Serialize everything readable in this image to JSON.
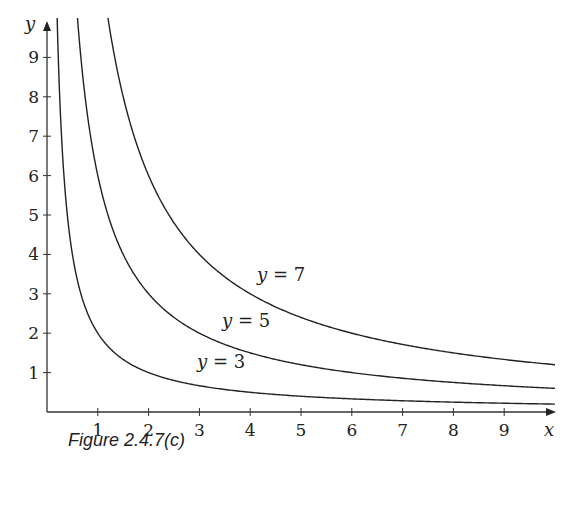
{
  "chart_data": {
    "type": "line",
    "title": "",
    "caption": "Figure 2.4.7(c)",
    "xlabel": "x",
    "ylabel": "y",
    "xlim": [
      0,
      10
    ],
    "ylim": [
      0,
      10
    ],
    "grid": false,
    "x_ticks": [
      1,
      2,
      3,
      4,
      5,
      6,
      7,
      8,
      9
    ],
    "y_ticks": [
      1,
      2,
      3,
      4,
      5,
      6,
      7,
      8,
      9
    ],
    "series": [
      {
        "name": "y = 3",
        "label_text": "y = 3",
        "formula_approx": "y = 2/x",
        "x": [
          0.2,
          0.25,
          0.5,
          1,
          2,
          3,
          4,
          5,
          6,
          7,
          8,
          9,
          10
        ],
        "values": [
          10,
          8,
          4,
          2,
          1,
          0.67,
          0.5,
          0.4,
          0.33,
          0.29,
          0.25,
          0.22,
          0.2
        ]
      },
      {
        "name": "y = 5",
        "label_text": "y = 5",
        "formula_approx": "y = 6/x",
        "x": [
          0.6,
          0.75,
          1,
          1.5,
          2,
          3,
          4,
          5,
          6,
          7,
          8,
          9,
          10
        ],
        "values": [
          10,
          8,
          6,
          4,
          3,
          2,
          1.5,
          1.2,
          1,
          0.86,
          0.75,
          0.67,
          0.6
        ]
      },
      {
        "name": "y = 7",
        "label_text": "y = 7",
        "formula_approx": "y = 12/x",
        "x": [
          1.2,
          1.5,
          2,
          3,
          4,
          5,
          6,
          7,
          8,
          9,
          10
        ],
        "values": [
          10,
          8,
          6,
          4,
          3,
          2.4,
          2,
          1.71,
          1.5,
          1.33,
          1.2
        ]
      }
    ],
    "annotations": [
      {
        "text": "y = 7",
        "x": 4.2,
        "y": 3.5
      },
      {
        "text": "y = 5",
        "x": 3.5,
        "y": 2.2
      },
      {
        "text": "y = 3",
        "x": 2.8,
        "y": 1.05
      }
    ]
  },
  "figure": {
    "caption": "Figure 2.4.7(c)",
    "x_axis_label": "x",
    "y_axis_label": "y",
    "x_tick_labels": [
      "1",
      "2",
      "3",
      "4",
      "5",
      "6",
      "7",
      "8",
      "9"
    ],
    "y_tick_labels": [
      "1",
      "2",
      "3",
      "4",
      "5",
      "6",
      "7",
      "8",
      "9"
    ],
    "curve_labels": [
      "y = 7",
      "y = 5",
      "y = 3"
    ]
  }
}
